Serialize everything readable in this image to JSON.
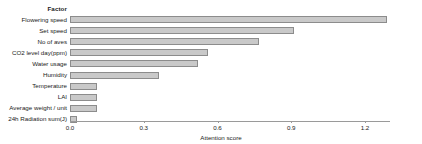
{
  "chart_data": {
    "type": "bar",
    "orientation": "horizontal",
    "title": "",
    "subtitle": "",
    "xlabel": "Attention score",
    "ylabel": "",
    "legend_title": "Factor",
    "legend_position": "none",
    "grid": false,
    "xlim": [
      0.0,
      1.3
    ],
    "xticks": [
      0.0,
      0.3,
      0.6,
      0.9,
      1.2
    ],
    "xtick_labels": [
      "0.0",
      "0.3",
      "0.6",
      "0.9",
      "1.2"
    ],
    "bar_color": "#c9c9c9",
    "bar_edge_color": "#8c8c8c",
    "categories": [
      "Flowering speed",
      "Set speed",
      "No of aves",
      "CO2 level day(ppm)",
      "Water usage",
      "Humidity",
      "Temperature",
      "LAI",
      "Average weight / unit",
      "24h Radiation sum(J)"
    ],
    "values": [
      1.29,
      0.91,
      0.77,
      0.56,
      0.52,
      0.36,
      0.11,
      0.11,
      0.11,
      0.03
    ]
  }
}
